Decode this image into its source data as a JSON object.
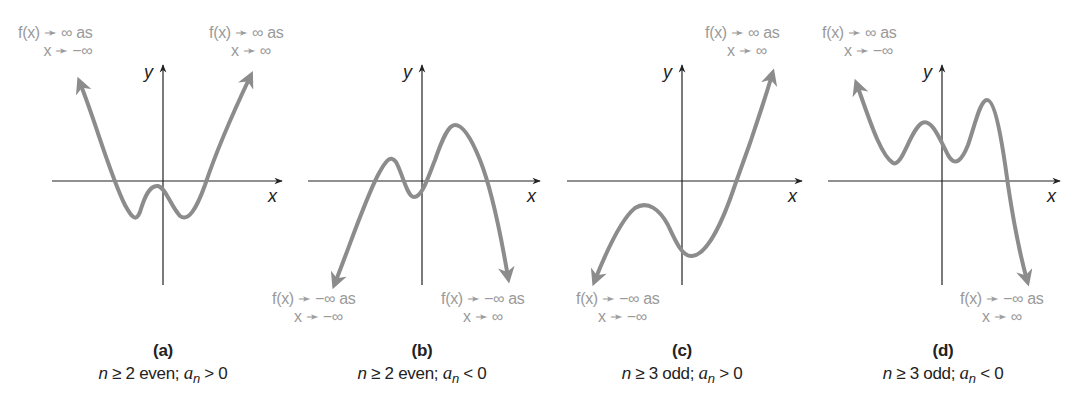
{
  "figure": {
    "axis_labels": {
      "x": "x",
      "y": "y"
    },
    "curve_color": "#8c8c8c",
    "axis_color": "#222222",
    "label_color": "#9a9a9a",
    "panels": [
      {
        "id": "a",
        "letter": "(a)",
        "condition": {
          "n_part": "n",
          "rel1": "≥ 2 even;",
          "an": "a",
          "sub": "n",
          "rel2": "> 0"
        },
        "end_labels": [
          {
            "line1": "f(x) ➛ ∞ as",
            "line2": "x ➛ −∞"
          },
          {
            "line1": "f(x) ➛ ∞ as",
            "line2": "x ➛ ∞"
          }
        ]
      },
      {
        "id": "b",
        "letter": "(b)",
        "condition": {
          "n_part": "n",
          "rel1": "≥ 2 even;",
          "an": "a",
          "sub": "n",
          "rel2": "< 0"
        },
        "end_labels": [
          {
            "line1": "f(x) ➛ −∞ as",
            "line2": "x ➛ −∞"
          },
          {
            "line1": "f(x) ➛ −∞ as",
            "line2": "x ➛ ∞"
          }
        ]
      },
      {
        "id": "c",
        "letter": "(c)",
        "condition": {
          "n_part": "n",
          "rel1": "≥ 3 odd;",
          "an": "a",
          "sub": "n",
          "rel2": "> 0"
        },
        "end_labels": [
          {
            "line1": "f(x) ➛ −∞ as",
            "line2": "x ➛ −∞"
          },
          {
            "line1": "f(x) ➛ ∞ as",
            "line2": "x ➛ ∞"
          }
        ]
      },
      {
        "id": "d",
        "letter": "(d)",
        "condition": {
          "n_part": "n",
          "rel1": "≥ 3 odd;",
          "an": "a",
          "sub": "n",
          "rel2": "< 0"
        },
        "end_labels": [
          {
            "line1": "f(x) ➛ ∞ as",
            "line2": "x ➛ −∞"
          },
          {
            "line1": "f(x) ➛ −∞ as",
            "line2": "x ➛ ∞"
          }
        ]
      }
    ]
  }
}
